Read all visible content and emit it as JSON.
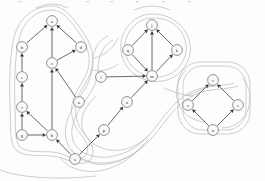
{
  "figure": {
    "type": "node-link-diagram",
    "background_color": "#fdfdfd",
    "node_fill_color": "#fafafa",
    "node_stroke_color": "#777777",
    "edge_color": "#5a5a5a",
    "contour_color": "#b9b9b9",
    "node_radius": 5.4
  },
  "nodes": [
    {
      "id": "a",
      "label": "a",
      "x": 52,
      "y": 21
    },
    {
      "id": "b",
      "label": "b",
      "x": 22,
      "y": 47
    },
    {
      "id": "c",
      "label": "c",
      "x": 52,
      "y": 63
    },
    {
      "id": "d",
      "label": "d",
      "x": 81,
      "y": 47
    },
    {
      "id": "e",
      "label": "e",
      "x": 22,
      "y": 77
    },
    {
      "id": "f",
      "label": "f",
      "x": 22,
      "y": 107
    },
    {
      "id": "g",
      "label": "g",
      "x": 22,
      "y": 135
    },
    {
      "id": "h",
      "label": "h",
      "x": 52,
      "y": 135
    },
    {
      "id": "n",
      "label": "n",
      "x": 79,
      "y": 102
    },
    {
      "id": "s",
      "label": "s",
      "x": 75,
      "y": 159
    },
    {
      "id": "l",
      "label": "l",
      "x": 101,
      "y": 77
    },
    {
      "id": "o",
      "label": "o",
      "x": 127,
      "y": 102
    },
    {
      "id": "p",
      "label": "p",
      "x": 104,
      "y": 130
    },
    {
      "id": "q",
      "label": "q",
      "x": 128,
      "y": 50
    },
    {
      "id": "j",
      "label": "j",
      "x": 152,
      "y": 25
    },
    {
      "id": "k",
      "label": "k",
      "x": 177,
      "y": 50
    },
    {
      "id": "m",
      "label": "m",
      "x": 152,
      "y": 76
    },
    {
      "id": "r",
      "label": "r",
      "x": 213,
      "y": 80
    },
    {
      "id": "t",
      "label": "t",
      "x": 238,
      "y": 105
    },
    {
      "id": "u",
      "label": "u",
      "x": 213,
      "y": 130
    },
    {
      "id": "v",
      "label": "v",
      "x": 188,
      "y": 105
    }
  ],
  "edges": [
    {
      "from": "b",
      "to": "a"
    },
    {
      "from": "c",
      "to": "a"
    },
    {
      "from": "d",
      "to": "a"
    },
    {
      "from": "e",
      "to": "b"
    },
    {
      "from": "f",
      "to": "e"
    },
    {
      "from": "g",
      "to": "f"
    },
    {
      "from": "h",
      "to": "f"
    },
    {
      "from": "g",
      "to": "h"
    },
    {
      "from": "c",
      "to": "d"
    },
    {
      "from": "n",
      "to": "c"
    },
    {
      "from": "h",
      "to": "c"
    },
    {
      "from": "s",
      "to": "h"
    },
    {
      "from": "s",
      "to": "p"
    },
    {
      "from": "p",
      "to": "o"
    },
    {
      "from": "l",
      "to": "m"
    },
    {
      "from": "q",
      "to": "m"
    },
    {
      "from": "m",
      "to": "j"
    },
    {
      "from": "m",
      "to": "k"
    },
    {
      "from": "q",
      "to": "j"
    },
    {
      "from": "k",
      "to": "j"
    },
    {
      "from": "o",
      "to": "m"
    },
    {
      "from": "u",
      "to": "v"
    },
    {
      "from": "u",
      "to": "t"
    },
    {
      "from": "v",
      "to": "r"
    },
    {
      "from": "t",
      "to": "r"
    }
  ],
  "clusters": [
    {
      "id": "cluster-left",
      "label": "left cluster"
    },
    {
      "id": "cluster-middle",
      "label": "middle cluster"
    },
    {
      "id": "cluster-right",
      "label": "right cluster"
    }
  ]
}
